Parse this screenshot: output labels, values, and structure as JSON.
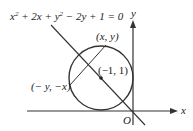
{
  "diagram": {
    "equation": {
      "x": "x",
      "sq1": "2",
      "mid1": " + 2x + ",
      "y": "y",
      "sq2": "2",
      "rest": " − 2y + 1 = 0"
    },
    "labels": {
      "point_xy": "(x, y)",
      "center": "(−1, 1)",
      "point_reflect": "(− y, −x)",
      "origin": "O",
      "x_axis": "x",
      "y_axis": "y"
    },
    "colors": {
      "stroke": "#333333",
      "text": "#222222",
      "background": "#ffffff"
    }
  }
}
